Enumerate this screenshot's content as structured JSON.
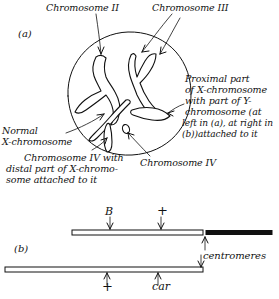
{
  "figure": {
    "panel_a_tag": "(a)",
    "panel_b_tag": "(b)"
  },
  "panel_a": {
    "labels": {
      "chromosome_ii": "Chromosome II",
      "chromosome_iii": "Chromosome III",
      "normal_x": "Normal\nX-chromosome",
      "normal_x_line1": "Normal",
      "normal_x_line2": "X-chromosome",
      "proximal_x": "Proximal part of X-chromosome with part of Y-chromosome (at left in (a), at right in (b)) attached to it",
      "proximal_x_line1": "Proximal part",
      "proximal_x_line2": "of X-chromosome",
      "proximal_x_line3": "with part of Y-",
      "proximal_x_line4": "chromosome (at",
      "proximal_x_line5": "left in (a), at right in",
      "proximal_x_line6": "(b))attached to it",
      "chromosome_iv_with_x": "Chromosome IV with distal part of X-chromosome attached to it",
      "chromosome_iv_with_x_line1": "Chromosome IV with",
      "chromosome_iv_with_x_line2": "distal part of X-chromo-",
      "chromosome_iv_with_x_line3": "some attached to it",
      "chromosome_iv": "Chromosome IV"
    }
  },
  "panel_b": {
    "upper_markers": [
      {
        "label": "B",
        "position_pct": 28
      },
      {
        "label": "+",
        "position_pct": 56
      }
    ],
    "lower_markers": [
      {
        "label": "+",
        "position_pct": 27
      },
      {
        "label": "car",
        "position_pct": 53
      }
    ],
    "centromeres_label": "centromeres"
  },
  "colors": {
    "ink": "#111111",
    "paper": "#ffffff"
  }
}
